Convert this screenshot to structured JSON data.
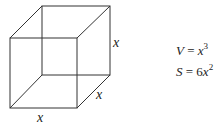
{
  "diagram": {
    "type": "cube",
    "edge_labels": [
      "x",
      "x",
      "x"
    ],
    "stroke_color": "#333333"
  },
  "formulas": {
    "volume": {
      "lhs": "V",
      "eq": " = ",
      "base": "x",
      "coef": "",
      "exp": "3"
    },
    "surface": {
      "lhs": "S",
      "eq": " = ",
      "base": "x",
      "coef": "6",
      "exp": "2"
    }
  }
}
